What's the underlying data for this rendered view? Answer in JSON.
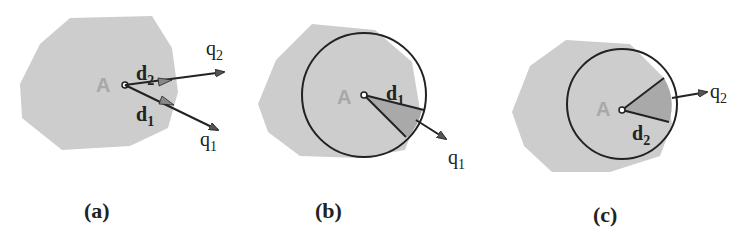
{
  "figure": {
    "colors": {
      "region": "#cdcdcd",
      "sector": "#a9a9a9",
      "stroke": "#222222",
      "point_label": "#a8a8a8"
    },
    "panels": [
      {
        "id": "a",
        "caption": "(a)",
        "point_label": "A",
        "vectors": [
          {
            "label": "d",
            "sub": "2",
            "target_label": "q",
            "target_sub": "2"
          },
          {
            "label": "d",
            "sub": "1",
            "target_label": "q",
            "target_sub": "1"
          }
        ]
      },
      {
        "id": "b",
        "caption": "(b)",
        "point_label": "A",
        "radius_label": "d",
        "radius_sub": "1",
        "target_label": "q",
        "target_sub": "1"
      },
      {
        "id": "c",
        "caption": "(c)",
        "point_label": "A",
        "radius_label": "d",
        "radius_sub": "2",
        "target_label": "q",
        "target_sub": "2"
      }
    ]
  }
}
